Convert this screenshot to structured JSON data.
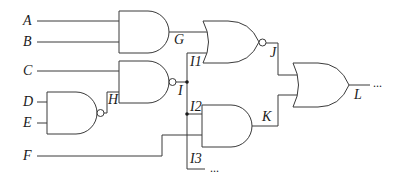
{
  "diagram": {
    "type": "logic-circuit",
    "inputs": [
      "A",
      "B",
      "C",
      "D",
      "E",
      "F"
    ],
    "intermediate": [
      "G",
      "H",
      "I",
      "I1",
      "I2",
      "I3",
      "J",
      "K"
    ],
    "output": "L",
    "ellipsis": "...",
    "labels": {
      "A": "A",
      "B": "B",
      "C": "C",
      "D": "D",
      "E": "E",
      "F": "F",
      "G": "G",
      "H": "H",
      "I": "I",
      "I1": "I1",
      "I2": "I2",
      "I3": "I3",
      "J": "J",
      "K": "K",
      "L": "L"
    },
    "gates": [
      {
        "id": "gate-and-g",
        "type": "AND",
        "inputs": [
          "A",
          "B"
        ],
        "output": "G"
      },
      {
        "id": "gate-nand-h",
        "type": "NAND",
        "inputs": [
          "D",
          "E"
        ],
        "output": "H"
      },
      {
        "id": "gate-nand-i",
        "type": "NAND",
        "inputs": [
          "C",
          "H"
        ],
        "output": "I"
      },
      {
        "id": "gate-nor-j",
        "type": "NOR",
        "inputs": [
          "G",
          "I1"
        ],
        "output": "J"
      },
      {
        "id": "gate-and-k",
        "type": "AND",
        "inputs": [
          "I2",
          "F"
        ],
        "output": "K"
      },
      {
        "id": "gate-or-l",
        "type": "OR",
        "inputs": [
          "J",
          "K"
        ],
        "output": "L"
      }
    ],
    "fanout": {
      "source": "I",
      "branches": [
        "I1",
        "I2",
        "I3"
      ]
    },
    "colors": {
      "line": "#3a3a3a",
      "text": "#1a1a1a",
      "background": "#ffffff"
    }
  }
}
